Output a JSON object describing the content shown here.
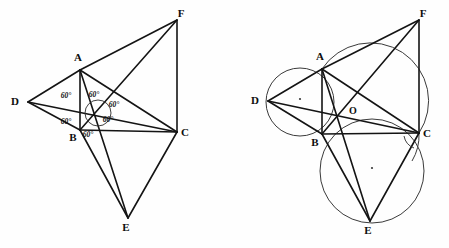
{
  "figure": {
    "background_color": "#fefefe",
    "stroke_color": "#141414",
    "circle_color": "#3a3a3a",
    "width": 449,
    "height": 248
  },
  "left_diagram": {
    "name": "fermat-point-angles",
    "vertices": [
      {
        "label": "A",
        "x": 80,
        "y": 70,
        "label_x": 78,
        "label_y": 61
      },
      {
        "label": "B",
        "x": 80,
        "y": 130,
        "label_x": 73,
        "label_y": 141
      },
      {
        "label": "C",
        "x": 177,
        "y": 132,
        "label_x": 185,
        "label_y": 136
      },
      {
        "label": "D",
        "x": 28,
        "y": 102,
        "label_x": 15,
        "label_y": 105
      },
      {
        "label": "E",
        "x": 128,
        "y": 218,
        "label_x": 126,
        "label_y": 231
      },
      {
        "label": "F",
        "x": 177,
        "y": 20,
        "label_x": 181,
        "label_y": 17
      }
    ],
    "fermat_point": {
      "x": 98,
      "y": 113
    },
    "segments": [
      {
        "from": "A",
        "to": "B"
      },
      {
        "from": "B",
        "to": "C"
      },
      {
        "from": "C",
        "to": "A"
      },
      {
        "from": "A",
        "to": "D"
      },
      {
        "from": "D",
        "to": "B"
      },
      {
        "from": "B",
        "to": "E"
      },
      {
        "from": "E",
        "to": "C"
      },
      {
        "from": "C",
        "to": "F"
      },
      {
        "from": "F",
        "to": "A"
      },
      {
        "from": "A",
        "to": "E"
      },
      {
        "from": "B",
        "to": "F"
      },
      {
        "from": "C",
        "to": "D"
      }
    ],
    "angle_labels": [
      {
        "text": "60°",
        "x": 66,
        "y": 98
      },
      {
        "text": "60°",
        "x": 94,
        "y": 97
      },
      {
        "text": "60°",
        "x": 114,
        "y": 107
      },
      {
        "text": "60°",
        "x": 66,
        "y": 124
      },
      {
        "text": "60°",
        "x": 108,
        "y": 122
      },
      {
        "text": "60°",
        "x": 88,
        "y": 137
      }
    ]
  },
  "right_diagram": {
    "name": "fermat-point-circumcircles",
    "vertices": [
      {
        "label": "A",
        "x": 322,
        "y": 69,
        "label_x": 320,
        "label_y": 60
      },
      {
        "label": "B",
        "x": 322,
        "y": 134,
        "label_x": 315,
        "label_y": 146
      },
      {
        "label": "C",
        "x": 419,
        "y": 133,
        "label_x": 427,
        "label_y": 137
      },
      {
        "label": "D",
        "x": 268,
        "y": 101,
        "label_x": 255,
        "label_y": 104
      },
      {
        "label": "E",
        "x": 370,
        "y": 221,
        "label_x": 368,
        "label_y": 234
      },
      {
        "label": "F",
        "x": 419,
        "y": 20,
        "label_x": 423,
        "label_y": 17
      }
    ],
    "fermat_point": {
      "label": "O",
      "x": 344,
      "y": 114,
      "label_x": 353,
      "label_y": 114
    },
    "segments": [
      {
        "from": "A",
        "to": "B"
      },
      {
        "from": "B",
        "to": "C"
      },
      {
        "from": "C",
        "to": "A"
      },
      {
        "from": "A",
        "to": "D"
      },
      {
        "from": "D",
        "to": "B"
      },
      {
        "from": "B",
        "to": "E"
      },
      {
        "from": "E",
        "to": "C"
      },
      {
        "from": "C",
        "to": "F"
      },
      {
        "from": "F",
        "to": "A"
      },
      {
        "from": "A",
        "to": "E"
      },
      {
        "from": "B",
        "to": "F"
      },
      {
        "from": "C",
        "to": "D"
      }
    ],
    "circles": [
      {
        "name": "circumcircle-ADB",
        "cx": 300,
        "cy": 102,
        "r": 34,
        "dot_x": 300,
        "dot_y": 99
      },
      {
        "name": "circumcircle-BEC",
        "cx": 372,
        "cy": 171,
        "r": 52,
        "dot_x": 372,
        "dot_y": 168
      },
      {
        "name": "circumcircle-AFC",
        "cx": 383,
        "cy": 103,
        "r": 50,
        "dot_x": 383,
        "dot_y": 103
      }
    ]
  }
}
